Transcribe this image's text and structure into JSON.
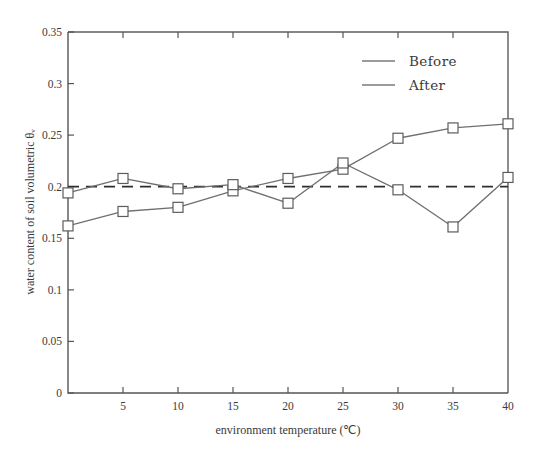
{
  "chart_data": {
    "type": "line",
    "title": "",
    "xlabel": "environment temperature (℃)",
    "ylabel": "water content of soil volumetric  θᵥ",
    "x": [
      0,
      5,
      10,
      15,
      20,
      25,
      30,
      35,
      40
    ],
    "xlim": [
      0,
      40
    ],
    "ylim": [
      0,
      0.35
    ],
    "xticks": [
      0,
      5,
      10,
      15,
      20,
      25,
      30,
      35,
      40
    ],
    "xtick_labels": [
      "",
      "5",
      "10",
      "15",
      "20",
      "25",
      "30",
      "35",
      "40"
    ],
    "yticks": [
      0,
      0.05,
      0.1,
      0.15,
      0.2,
      0.25,
      0.3,
      0.35
    ],
    "ytick_labels": [
      "0",
      "0.05",
      "0.1",
      "0.15",
      "0.2",
      "0.25",
      "0.3",
      "0.35"
    ],
    "grid": false,
    "legend_position": "top-right",
    "series": [
      {
        "name": "Before",
        "marker": "square",
        "color": "#6f6f6f",
        "values": [
          0.162,
          0.176,
          0.18,
          0.196,
          0.208,
          0.217,
          0.247,
          0.257,
          0.261
        ]
      },
      {
        "name": "After",
        "marker": "square",
        "color": "#6f6f6f",
        "values": [
          0.194,
          0.208,
          0.198,
          0.202,
          0.184,
          0.223,
          0.197,
          0.161,
          0.209
        ]
      }
    ],
    "annotations": [
      {
        "type": "reference-line",
        "orientation": "horizontal",
        "value": 0.2,
        "style": "dashed",
        "color": "#2e2e2e"
      }
    ]
  },
  "legend": {
    "entries": [
      {
        "label": "Before"
      },
      {
        "label": "After"
      }
    ]
  },
  "axes": {
    "x_title": "environment temperature (℃)",
    "y_title": "water content of soil volumetric  θᵥ"
  }
}
